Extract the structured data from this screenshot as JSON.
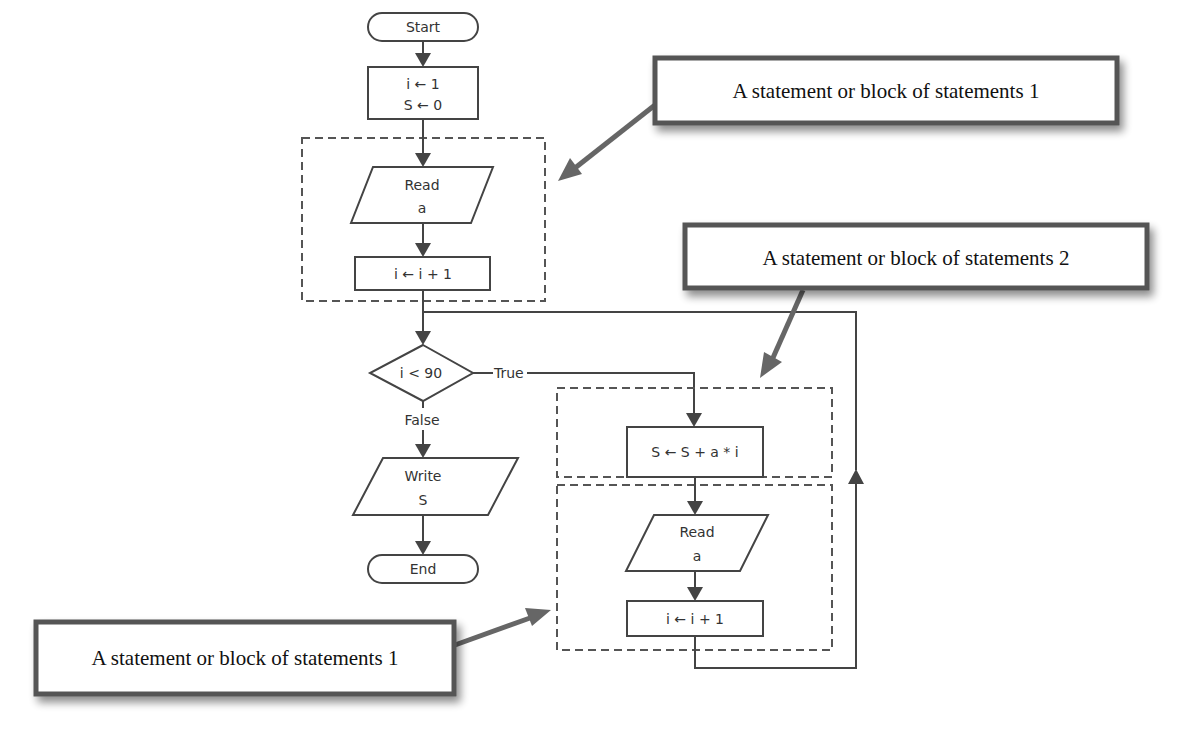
{
  "diagram": {
    "type": "flowchart",
    "nodes": {
      "start": {
        "label": "Start",
        "shape": "terminator"
      },
      "init": {
        "line1": "i ← 1",
        "line2": "S ← 0",
        "shape": "process"
      },
      "read1": {
        "line1": "Read",
        "line2": "a",
        "shape": "input"
      },
      "inc1": {
        "label": "i ← i + 1",
        "shape": "process"
      },
      "decision": {
        "label": "i < 90",
        "shape": "decision"
      },
      "true_label": "True",
      "false_label": "False",
      "write": {
        "line1": "Write",
        "line2": "S",
        "shape": "output"
      },
      "end": {
        "label": "End",
        "shape": "terminator"
      },
      "accumulate": {
        "label": "S ← S + a * i",
        "shape": "process"
      },
      "read2": {
        "line1": "Read",
        "line2": "a",
        "shape": "input"
      },
      "inc2": {
        "label": "i ← i + 1",
        "shape": "process"
      }
    },
    "callouts": [
      {
        "id": "callout-top",
        "label": "A statement or block of statements 1",
        "points_to": "block-1-top"
      },
      {
        "id": "callout-middle",
        "label": "A statement or block of statements 2",
        "points_to": "block-2"
      },
      {
        "id": "callout-bottom",
        "label": "A statement or block of statements 1",
        "points_to": "block-1-loop"
      }
    ],
    "colors": {
      "line": "#444444",
      "dashed_border": "#555555",
      "callout_border": "#555555",
      "callout_arrow": "#666666",
      "background": "#ffffff"
    }
  }
}
